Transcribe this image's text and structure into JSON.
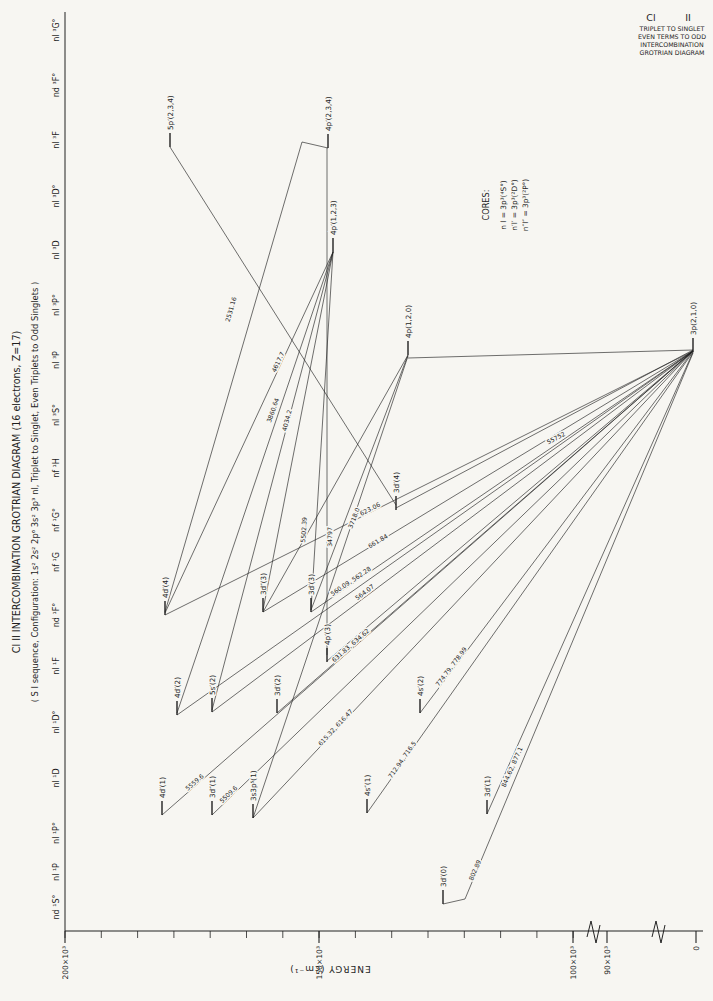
{
  "page": {
    "width": 713,
    "height": 1001,
    "bg": "#f7f6f2",
    "ink": "#222222"
  },
  "corner_title": {
    "element": "Cl",
    "ion": "II",
    "lines": [
      "TRIPLET TO SINGLET",
      "EVEN TERMS TO ODD",
      "INTERCOMBINATION",
      "GROTRIAN DIAGRAM"
    ]
  },
  "titles": {
    "main": "Cl II INTERCOMBINATION GROTRIAN DIAGRAM (16 electrons, Z=17)",
    "sub": "( S I sequence, Configuration: 1s² 2s² 2p⁶ 3s² 3p³ nl, Triplet to Singlet, Even Triplets to Odd Singlets )"
  },
  "cores": {
    "heading": "CORES:",
    "items": [
      "n l  =  3p³(⁴S°)",
      "n′l′  =  3p³(²D°)",
      "n″l″  =  3p³(²P°)"
    ]
  },
  "axis": {
    "label": "ENERGY  (cm⁻¹)",
    "y": 931,
    "border_x": 65,
    "x_end": 703,
    "border_top": 12,
    "major_ticks": [
      {
        "label": "200×10³",
        "x": 65
      },
      {
        "label": "150×10³",
        "x": 319
      },
      {
        "label": "100×10³",
        "x": 573
      },
      {
        "label": "90×10³",
        "x": 607
      },
      {
        "label": "0",
        "x": 696
      }
    ],
    "minor_tick_start": 65,
    "minor_tick_step": 36.3,
    "minor_tick_count": 14,
    "breaks": [
      592,
      657
    ]
  },
  "terms": [
    {
      "label": "nl ³G°",
      "y": 30
    },
    {
      "label": "nd ³F°",
      "y": 85
    },
    {
      "label": "nl ³F",
      "y": 140
    },
    {
      "label": "nl ³D°",
      "y": 196
    },
    {
      "label": "nl ³D",
      "y": 250
    },
    {
      "label": "nl ³P°",
      "y": 305
    },
    {
      "label": "nl ³P",
      "y": 360
    },
    {
      "label": "nl ³S°",
      "y": 415
    },
    {
      "label": "nf ¹H",
      "y": 468
    },
    {
      "label": "nf ¹G°",
      "y": 520
    },
    {
      "label": "nf ¹G",
      "y": 562
    },
    {
      "label": "nd ¹F°",
      "y": 615
    },
    {
      "label": "nl ¹F",
      "y": 666
    },
    {
      "label": "nl ¹D°",
      "y": 722
    },
    {
      "label": "nl ¹D",
      "y": 778
    },
    {
      "label": "nl ¹P°",
      "y": 833
    },
    {
      "label": "nl ¹P",
      "y": 872
    },
    {
      "label": "nd ¹S°",
      "y": 907
    }
  ],
  "levels": [
    {
      "label": "5p′(2,3,4)",
      "x": 170,
      "y": 133
    },
    {
      "label": "4p′(2,3,4)",
      "x": 328,
      "y": 134
    },
    {
      "label": "4p′(1,2,3)",
      "x": 333,
      "y": 238
    },
    {
      "label": "4p(1,2,0)",
      "x": 408,
      "y": 341
    },
    {
      "label": "3p(2,1,0)",
      "x": 693,
      "y": 338
    },
    {
      "label": "3d′(4)",
      "x": 396,
      "y": 496
    },
    {
      "label": "4d′(4)",
      "x": 165,
      "y": 601
    },
    {
      "label": "3d″(3)",
      "x": 263,
      "y": 598
    },
    {
      "label": "3d′(3)",
      "x": 311,
      "y": 598
    },
    {
      "label": "4p′(3)",
      "x": 327,
      "y": 648
    },
    {
      "label": "4d′(2)",
      "x": 177,
      "y": 701
    },
    {
      "label": "5s′(2)",
      "x": 212,
      "y": 698
    },
    {
      "label": "3d′(2)",
      "x": 277,
      "y": 699
    },
    {
      "label": "4s′(2)",
      "x": 420,
      "y": 699
    },
    {
      "label": "4d′(1)",
      "x": 162,
      "y": 801
    },
    {
      "label": "3d″(1)",
      "x": 212,
      "y": 801
    },
    {
      "label": "3s3p⁵(1)",
      "x": 253,
      "y": 804
    },
    {
      "label": "4s″(1)",
      "x": 367,
      "y": 799
    },
    {
      "label": "3d′(1)",
      "x": 487,
      "y": 800
    },
    {
      "label": "3d′(0)",
      "x": 443,
      "y": 890
    }
  ],
  "tick_len": 14,
  "transitions": [
    {
      "pts": [
        [
          328,
          148
        ],
        [
          302,
          142
        ],
        [
          165,
          612
        ]
      ],
      "label": "2531.16",
      "lx": 233,
      "ly": 310,
      "angle": -74
    },
    {
      "pts": [
        [
          327,
          148
        ],
        [
          327,
          655
        ]
      ],
      "label": "34797",
      "lx": 332,
      "ly": 537,
      "angle": -90
    },
    {
      "pts": [
        [
          333,
          252
        ],
        [
          311,
          610
        ]
      ],
      "label": "5502.39",
      "lx": 306,
      "ly": 530,
      "angle": -86
    },
    {
      "pts": [
        [
          333,
          252
        ],
        [
          263,
          610
        ]
      ],
      "label": "",
      "lx": 0,
      "ly": 0,
      "angle": 0
    },
    {
      "pts": [
        [
          165,
          613
        ],
        [
          333,
          252
        ]
      ],
      "label": "4617.7",
      "lx": 280,
      "ly": 363,
      "angle": -65
    },
    {
      "pts": [
        [
          177,
          713
        ],
        [
          333,
          252
        ]
      ],
      "label": "3860.64",
      "lx": 275,
      "ly": 411,
      "angle": -71
    },
    {
      "pts": [
        [
          212,
          710
        ],
        [
          333,
          252
        ]
      ],
      "label": "4034.2",
      "lx": 289,
      "ly": 421,
      "angle": -75
    },
    {
      "pts": [
        [
          408,
          355
        ],
        [
          311,
          610
        ]
      ],
      "label": "3718.0",
      "lx": 356,
      "ly": 519,
      "angle": -69
    },
    {
      "pts": [
        [
          408,
          355
        ],
        [
          263,
          612
        ]
      ],
      "label": "",
      "lx": 0,
      "ly": 0,
      "angle": 0
    },
    {
      "pts": [
        [
          170,
          147
        ],
        [
          396,
          505
        ]
      ],
      "label": "",
      "lx": 0,
      "ly": 0,
      "angle": 0
    },
    {
      "pts": [
        [
          396,
          508
        ],
        [
          693,
          350
        ]
      ],
      "label": "55752",
      "lx": 557,
      "ly": 440,
      "angle": -28
    },
    {
      "pts": [
        [
          443,
          904
        ],
        [
          465,
          899
        ],
        [
          693,
          353
        ]
      ],
      "label": "802.89",
      "lx": 477,
      "ly": 871,
      "angle": -67
    },
    {
      "pts": [
        [
          487,
          814
        ],
        [
          693,
          352
        ]
      ],
      "label": "844.62, 877.1",
      "lx": 514,
      "ly": 768,
      "angle": -66
    },
    {
      "pts": [
        [
          367,
          813
        ],
        [
          693,
          352
        ]
      ],
      "label": "712.94, 716.5",
      "lx": 404,
      "ly": 761,
      "angle": -55
    },
    {
      "pts": [
        [
          420,
          713
        ],
        [
          693,
          351
        ]
      ],
      "label": "774.79, 778.99",
      "lx": 453,
      "ly": 668,
      "angle": -53
    },
    {
      "pts": [
        [
          253,
          818
        ],
        [
          693,
          351
        ]
      ],
      "label": "615.32, 616.47",
      "lx": 337,
      "ly": 729,
      "angle": -47
    },
    {
      "pts": [
        [
          212,
          815
        ],
        [
          693,
          351
        ]
      ],
      "label": "5509.6",
      "lx": 230,
      "ly": 796,
      "angle": -44
    },
    {
      "pts": [
        [
          162,
          815
        ],
        [
          693,
          351
        ]
      ],
      "label": "5559.6",
      "lx": 196,
      "ly": 784,
      "angle": -41
    },
    {
      "pts": [
        [
          277,
          713
        ],
        [
          693,
          351
        ]
      ],
      "label": "631.83, 634.62",
      "lx": 352,
      "ly": 647,
      "angle": -41
    },
    {
      "pts": [
        [
          263,
          612
        ],
        [
          693,
          351
        ]
      ],
      "label": "661.84",
      "lx": 379,
      "ly": 543,
      "angle": -31
    },
    {
      "pts": [
        [
          311,
          612
        ],
        [
          693,
          351
        ]
      ],
      "label": "560.09, 562.28",
      "lx": 352,
      "ly": 583,
      "angle": -34
    },
    {
      "pts": [
        [
          212,
          712
        ],
        [
          693,
          351
        ]
      ],
      "label": "564.07",
      "lx": 366,
      "ly": 594,
      "angle": -37
    },
    {
      "pts": [
        [
          165,
          615
        ],
        [
          693,
          351
        ]
      ],
      "label": "623.06",
      "lx": 371,
      "ly": 511,
      "angle": -27
    },
    {
      "pts": [
        [
          177,
          715
        ],
        [
          693,
          351
        ]
      ],
      "label": "",
      "lx": 0,
      "ly": 0,
      "angle": 0
    },
    {
      "pts": [
        [
          327,
          661
        ],
        [
          693,
          351
        ]
      ],
      "label": "",
      "lx": 0,
      "ly": 0,
      "angle": 0
    },
    {
      "pts": [
        [
          408,
          358
        ],
        [
          693,
          350
        ]
      ],
      "label": "",
      "lx": 0,
      "ly": 0,
      "angle": 0
    },
    {
      "pts": [
        [
          253,
          818
        ],
        [
          408,
          356
        ]
      ],
      "label": "",
      "lx": 0,
      "ly": 0,
      "angle": 0
    }
  ]
}
